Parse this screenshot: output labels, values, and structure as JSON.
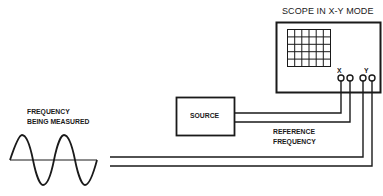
{
  "diagram": {
    "scope_label": "SCOPE IN X-Y MODE",
    "x_label": "X",
    "y_label": "Y",
    "source_label": "SOURCE",
    "reference_label_line1": "REFERENCE",
    "reference_label_line2": "FREQUENCY",
    "measured_label_line1": "FREQUENCY",
    "measured_label_line2": "BEING MEASURED",
    "line_color": "#1a1a1a"
  }
}
